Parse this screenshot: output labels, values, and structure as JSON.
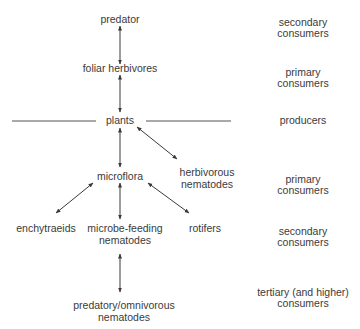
{
  "diagram": {
    "nodes": {
      "predator": "predator",
      "foliar_herbivores": "foliar herbivores",
      "plants": "plants",
      "microflora": "microflora",
      "herbivorous_nematodes": [
        "herbivorous",
        "nematodes"
      ],
      "enchytraeids": "enchytraeids",
      "microbe_feeding_nematodes": [
        "microbe-feeding",
        "nematodes"
      ],
      "rotifers": "rotifers",
      "predatory_omnivorous_nematodes": [
        "predatory/omnivorous",
        "nematodes"
      ]
    },
    "levels": [
      {
        "lines": [
          "secondary",
          "consumers"
        ]
      },
      {
        "lines": [
          "primary",
          "consumers"
        ]
      },
      {
        "lines": [
          "producers"
        ]
      },
      {
        "lines": [
          "primary",
          "consumers"
        ]
      },
      {
        "lines": [
          "secondary",
          "consumers"
        ]
      },
      {
        "lines": [
          "tertiary (and higher)",
          "consumers"
        ]
      }
    ],
    "colors": {
      "text": "#3a3a3a",
      "line": "#3a3a3a"
    }
  }
}
